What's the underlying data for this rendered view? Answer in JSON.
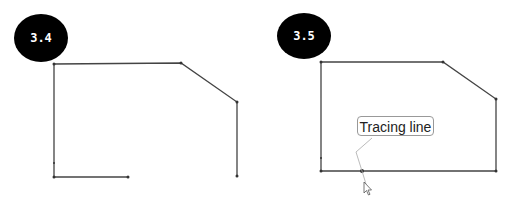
{
  "panels": [
    {
      "id": "step-3-4",
      "badge": "3.4"
    },
    {
      "id": "step-3-5",
      "badge": "3.5",
      "tooltip": "Tracing line"
    }
  ],
  "colors": {
    "badge": "#000000",
    "line": "#444444",
    "tooltip_border": "#999999"
  }
}
